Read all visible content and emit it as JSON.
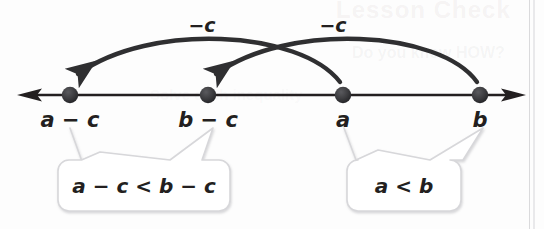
{
  "figure": {
    "type": "number-line-diagram",
    "caption_topic": "Subtraction Property of Inequality",
    "colors": {
      "line": "#231f20",
      "point": "#3a3a3c",
      "arc": "#2f2f31",
      "callout_border": "#d5d5d8",
      "callout_fill": "#ffffff",
      "background": "#fdfdfd"
    },
    "number_line": {
      "left_arrow": "◄",
      "right_arrow": "►",
      "y": 95,
      "start_x": 18,
      "end_x": 524
    },
    "points": [
      {
        "id": "a-minus-c",
        "label": "a − c",
        "x": 70
      },
      {
        "id": "b-minus-c",
        "label": "b − c",
        "x": 208
      },
      {
        "id": "a",
        "label": "a",
        "x": 343
      },
      {
        "id": "b",
        "label": "b",
        "x": 480
      }
    ],
    "arcs": [
      {
        "id": "arc-a-to-a-minus-c",
        "label": "−c",
        "label_x": 202,
        "label_y": 18,
        "from_point": "a",
        "to_point": "a-minus-c",
        "direction": "leftward"
      },
      {
        "id": "arc-b-to-b-minus-c",
        "label": "−c",
        "label_x": 333,
        "label_y": 18,
        "from_point": "b",
        "to_point": "b-minus-c",
        "direction": "leftward"
      }
    ],
    "callouts": [
      {
        "id": "callout-left",
        "text": "a − c < b − c",
        "center_x": 144,
        "center_y": 186,
        "width": 172,
        "height": 44,
        "points_to": [
          "a-minus-c",
          "b-minus-c"
        ]
      },
      {
        "id": "callout-right",
        "text": "a < b",
        "center_x": 404,
        "center_y": 186,
        "width": 110,
        "height": 44,
        "points_to": [
          "a",
          "b"
        ]
      }
    ],
    "ghost_bleed_text": {
      "line1": "Lesson Check",
      "line2": "Do you know HOW?",
      "line3": "Solve each inequality"
    }
  }
}
